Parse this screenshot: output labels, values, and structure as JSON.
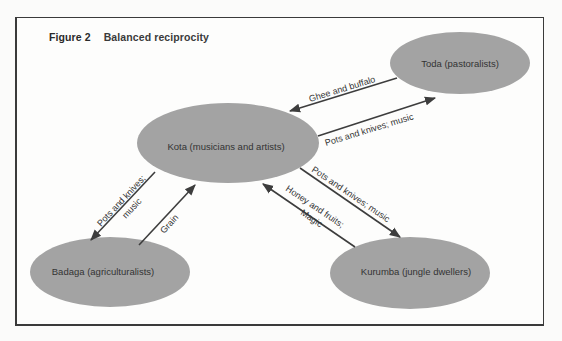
{
  "figure": {
    "number_label": "Figure 2",
    "title": "Balanced reciprocity"
  },
  "colors": {
    "node_fill": "#a3a3a3",
    "arrow": "#3d3d3d",
    "frame": "#3a3a3a",
    "text": "#333333"
  },
  "nodes": [
    {
      "id": "toda",
      "label": "Toda (pastoralists)"
    },
    {
      "id": "kota",
      "label": "Kota (musicians and artists)"
    },
    {
      "id": "badaga",
      "label": "Badaga (agriculturalists)"
    },
    {
      "id": "kurumba",
      "label": "Kurumba (jungle dwellers)"
    }
  ],
  "edges": [
    {
      "from": "toda",
      "to": "kota",
      "label": "Ghee and buffalo"
    },
    {
      "from": "kota",
      "to": "toda",
      "label": "Pots and knives; music"
    },
    {
      "from": "kota",
      "to": "badaga",
      "label_line1": "Pots and knives;",
      "label_line2": "music"
    },
    {
      "from": "badaga",
      "to": "kota",
      "label": "Grain"
    },
    {
      "from": "kota",
      "to": "kurumba",
      "label": "Pots and knives; music"
    },
    {
      "from": "kurumba",
      "to": "kota",
      "label_line1": "Honey and fruits;",
      "label_line2": "Magic"
    }
  ]
}
